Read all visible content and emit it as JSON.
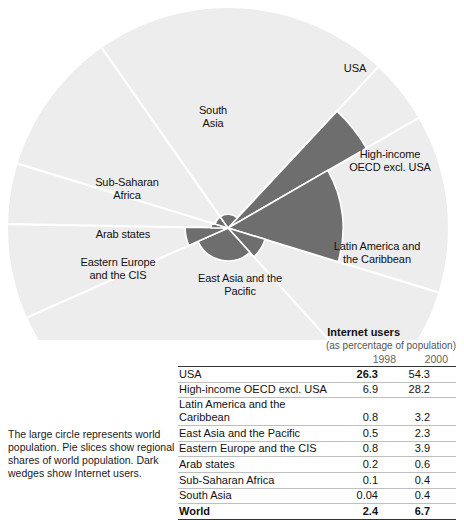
{
  "caption": "The large circle represents world population. Pie slices show regional shares of world population. Dark wedges show Internet users.",
  "table": {
    "title": "Internet users",
    "subtitle": "(as percentage of population)",
    "year_headers": [
      "1998",
      "2000"
    ],
    "rows": [
      {
        "region": "USA",
        "y1998": "26.3",
        "y2000": "54.3"
      },
      {
        "region": "High-income OECD excl. USA",
        "y1998": "6.9",
        "y2000": "28.2"
      },
      {
        "region": "Latin America and the Caribbean",
        "y1998": "0.8",
        "y2000": "3.2"
      },
      {
        "region": "East Asia and the Pacific",
        "y1998": "0.5",
        "y2000": "2.3"
      },
      {
        "region": "Eastern Europe and the CIS",
        "y1998": "0.8",
        "y2000": "3.9"
      },
      {
        "region": "Arab states",
        "y1998": "0.2",
        "y2000": "0.6"
      },
      {
        "region": "Sub-Saharan Africa",
        "y1998": "0.1",
        "y2000": "0.4"
      },
      {
        "region": "South Asia",
        "y1998": "0.04",
        "y2000": "0.4"
      },
      {
        "region": "World",
        "y1998": "2.4",
        "y2000": "6.7"
      }
    ]
  },
  "pie_labels": [
    {
      "id": "usa",
      "text": "USA",
      "x": 325,
      "y": 62,
      "w": 60
    },
    {
      "id": "high-income-oecd",
      "text": "High-income\nOECD excl. USA",
      "x": 330,
      "y": 148,
      "w": 120
    },
    {
      "id": "latin-america",
      "text": "Latin America and\nthe Caribbean",
      "x": 312,
      "y": 240,
      "w": 130
    },
    {
      "id": "east-asia",
      "text": "East Asia and the\nPacific",
      "x": 180,
      "y": 272,
      "w": 120
    },
    {
      "id": "eastern-europe",
      "text": "Eastern Europe\nand the CIS",
      "x": 58,
      "y": 256,
      "w": 120
    },
    {
      "id": "arab-states",
      "text": "Arab states",
      "x": 78,
      "y": 228,
      "w": 90
    },
    {
      "id": "sub-saharan-africa",
      "text": "Sub-Saharan\nAfrica",
      "x": 72,
      "y": 176,
      "w": 110
    },
    {
      "id": "south-asia",
      "text": "South\nAsia",
      "x": 178,
      "y": 104,
      "w": 70
    }
  ],
  "chart_data": {
    "type": "pie",
    "title": "Internet users (as percentage of population)",
    "center": {
      "x": 228,
      "y": 228
    },
    "radius": 220,
    "background_color": "#ededed",
    "wedge_color": "#6e6e6e",
    "divider_color": "#ffffff",
    "categories": [
      "USA",
      "High-income OECD excl. USA",
      "Latin America and the Caribbean",
      "East Asia and the Pacific",
      "Eastern Europe and the CIS",
      "Arab states",
      "Sub-Saharan Africa",
      "South Asia"
    ],
    "population_share_percent": [
      4.7,
      13.0,
      8.5,
      30.0,
      7.0,
      4.5,
      10.5,
      21.8
    ],
    "slice_angles_deg": {
      "note": "start/end measured clockwise from 12 o'clock (0deg = up)",
      "slices": [
        {
          "name": "USA",
          "start": 43,
          "end": 60
        },
        {
          "name": "High-income OECD excl. USA",
          "start": 60,
          "end": 107
        },
        {
          "name": "Latin America and the Caribbean",
          "start": 107,
          "end": 138
        },
        {
          "name": "East Asia and the Pacific",
          "start": 138,
          "end": 246
        },
        {
          "name": "Eastern Europe and the CIS",
          "start": 246,
          "end": 271
        },
        {
          "name": "Arab states",
          "start": 271,
          "end": 287
        },
        {
          "name": "Sub-Saharan Africa",
          "start": 287,
          "end": 325
        },
        {
          "name": "South Asia",
          "start": 325,
          "end": 43
        }
      ]
    },
    "series": [
      {
        "name": "Internet users 1998 (% of population)",
        "values": [
          26.3,
          6.9,
          0.8,
          0.5,
          0.8,
          0.2,
          0.1,
          0.04
        ]
      },
      {
        "name": "Internet users 2000 (% of population)",
        "values": [
          54.3,
          28.2,
          3.2,
          2.3,
          3.9,
          0.6,
          0.4,
          0.4
        ]
      }
    ],
    "world": {
      "y1998": 2.4,
      "y2000": 6.7
    },
    "legend": "none",
    "grid": false
  }
}
